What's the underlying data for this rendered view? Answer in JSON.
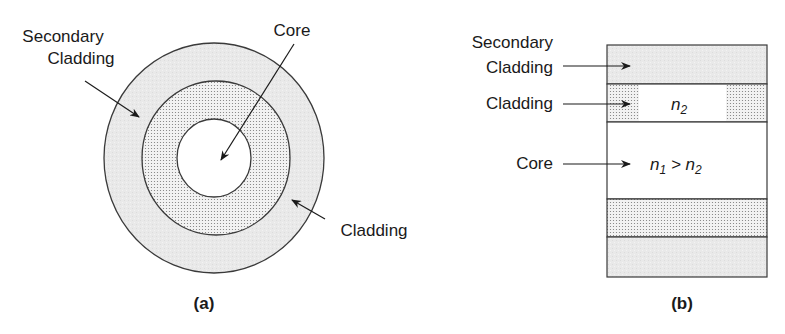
{
  "figure": {
    "colors": {
      "outline": "#3a3a3a",
      "secondary_cladding_fill": "#e9e9e9",
      "cladding_fill": "#f2f2f2",
      "cladding_dot": "#7a7a7a",
      "core_fill": "#ffffff",
      "text": "#1a1a1a"
    },
    "panel_a": {
      "caption": "(a)",
      "labels": {
        "secondary_cladding_line1": "Secondary",
        "secondary_cladding_line2": "Cladding",
        "core": "Core",
        "cladding": "Cladding"
      },
      "layers": [
        {
          "name": "secondary-cladding",
          "shape": "ellipse",
          "cx": 214,
          "cy": 158,
          "rx": 110,
          "ry": 115
        },
        {
          "name": "cladding",
          "shape": "ellipse",
          "cx": 216,
          "cy": 158,
          "rx": 74,
          "ry": 77
        },
        {
          "name": "core",
          "shape": "ellipse",
          "cx": 214,
          "cy": 158,
          "rx": 37,
          "ry": 39
        }
      ]
    },
    "panel_b": {
      "caption": "(b)",
      "labels": {
        "secondary_cladding_line1": "Secondary",
        "secondary_cladding_line2": "Cladding",
        "cladding": "Cladding",
        "core": "Core"
      },
      "cladding_index": {
        "symbol": "n",
        "subscript": "2"
      },
      "core_index": {
        "symbol1": "n",
        "sub1": "1",
        "relation": " > ",
        "symbol2": "n",
        "sub2": "2"
      },
      "bands": [
        {
          "name": "secondary-cladding-top",
          "y_top": 45,
          "y_bottom": 84
        },
        {
          "name": "cladding-top",
          "y_top": 84,
          "y_bottom": 122
        },
        {
          "name": "core",
          "y_top": 122,
          "y_bottom": 199
        },
        {
          "name": "cladding-bottom",
          "y_top": 199,
          "y_bottom": 237
        },
        {
          "name": "secondary-cladding-bottom",
          "y_top": 237,
          "y_bottom": 277
        }
      ]
    }
  }
}
